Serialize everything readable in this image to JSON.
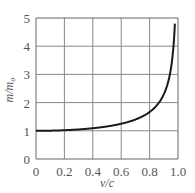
{
  "chart_data": {
    "type": "line",
    "title": "",
    "xlabel": "v/c",
    "ylabel": "m/m₀",
    "xlim": [
      0,
      1.0
    ],
    "ylim": [
      0,
      5
    ],
    "grid": true,
    "legend": null,
    "x_ticks": [
      "0",
      "0.2",
      "0.4",
      "0.6",
      "0.8",
      "1.0"
    ],
    "y_ticks": [
      "0",
      "1",
      "2",
      "3",
      "4",
      "5"
    ],
    "series": [
      {
        "name": "relativistic mass ratio",
        "formula": "m/m0 = 1/sqrt(1 - (v/c)^2)",
        "x": [
          0,
          0.1,
          0.2,
          0.3,
          0.4,
          0.5,
          0.6,
          0.7,
          0.8,
          0.85,
          0.9,
          0.92,
          0.94,
          0.96,
          0.98
        ],
        "y": [
          1.0,
          1.005,
          1.02,
          1.048,
          1.091,
          1.155,
          1.25,
          1.4,
          1.667,
          1.898,
          2.294,
          2.552,
          2.931,
          3.571,
          5.025
        ]
      }
    ],
    "colors": {
      "line": "#1a1a1a",
      "grid": "#888888",
      "axis": "#666666"
    }
  }
}
